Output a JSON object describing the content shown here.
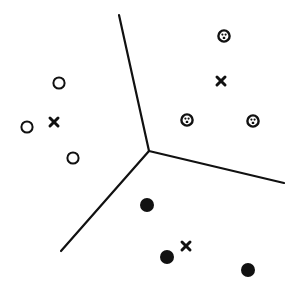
{
  "diagram": {
    "type": "voronoi-clustering",
    "width": 299,
    "height": 288,
    "stroke_color": "#111111",
    "background": "#ffffff",
    "junction": {
      "x": 149,
      "y": 151
    },
    "boundaries": [
      {
        "x1": 149,
        "y1": 151,
        "x2": 119,
        "y2": 15
      },
      {
        "x1": 149,
        "y1": 151,
        "x2": 61,
        "y2": 251
      },
      {
        "x1": 149,
        "y1": 151,
        "x2": 284,
        "y2": 183
      }
    ],
    "clusters": [
      {
        "name": "open-circle-cluster",
        "marker": "open-circle",
        "points": [
          {
            "x": 59,
            "y": 83
          },
          {
            "x": 27,
            "y": 127
          },
          {
            "x": 73,
            "y": 158
          }
        ],
        "centroid": {
          "x": 54,
          "y": 122
        }
      },
      {
        "name": "dotted-circle-cluster",
        "marker": "dotted-circle",
        "points": [
          {
            "x": 224,
            "y": 36
          },
          {
            "x": 187,
            "y": 120
          },
          {
            "x": 253,
            "y": 121
          }
        ],
        "centroid": {
          "x": 221,
          "y": 81
        }
      },
      {
        "name": "filled-circle-cluster",
        "marker": "filled-circle",
        "points": [
          {
            "x": 147,
            "y": 205
          },
          {
            "x": 167,
            "y": 257
          },
          {
            "x": 248,
            "y": 270
          }
        ],
        "centroid": {
          "x": 186,
          "y": 246
        }
      }
    ]
  }
}
